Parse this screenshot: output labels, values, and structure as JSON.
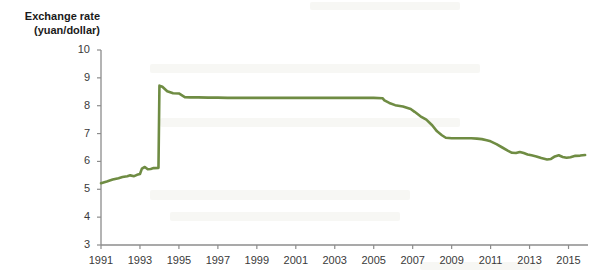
{
  "chart_data": {
    "type": "line",
    "title": "",
    "ylabel_line1": "Exchange rate",
    "ylabel_line2": "(yuan/dollar)",
    "xlabel": "",
    "ylim": [
      3,
      10
    ],
    "xlim": [
      1991,
      2016
    ],
    "grid": false,
    "legend": "none",
    "line_color": "#6f8c43",
    "axis_color": "#8c8c8c",
    "y_ticks": [
      10,
      9,
      8,
      7,
      6,
      5,
      4,
      3
    ],
    "x_ticks": [
      1991,
      1993,
      1995,
      1997,
      1999,
      2001,
      2003,
      2005,
      2007,
      2009,
      2011,
      2013,
      2015
    ],
    "series": [
      {
        "name": "Chinese yuan per U.S. dollar",
        "x": [
          1991.0,
          1991.3,
          1991.6,
          1991.9,
          1992.1,
          1992.35,
          1992.5,
          1992.7,
          1992.85,
          1993.0,
          1993.1,
          1993.25,
          1993.4,
          1993.55,
          1993.7,
          1993.95,
          1994.0,
          1994.15,
          1994.4,
          1994.7,
          1995.0,
          1995.3,
          1995.6,
          1996.0,
          1996.5,
          1997.0,
          1997.5,
          1998.0,
          1998.5,
          1999.0,
          1999.5,
          2000.0,
          2001.0,
          2002.0,
          2003.0,
          2004.0,
          2005.0,
          2005.45,
          2005.55,
          2005.8,
          2006.1,
          2006.5,
          2006.9,
          2007.1,
          2007.4,
          2007.7,
          2008.0,
          2008.25,
          2008.5,
          2008.7,
          2009.0,
          2009.5,
          2010.0,
          2010.3,
          2010.55,
          2010.8,
          2011.0,
          2011.3,
          2011.6,
          2011.9,
          2012.1,
          2012.3,
          2012.5,
          2012.7,
          2012.9,
          2013.1,
          2013.35,
          2013.6,
          2013.9,
          2014.1,
          2014.3,
          2014.5,
          2014.7,
          2014.9,
          2015.1,
          2015.35,
          2015.6,
          2015.85
        ],
        "y": [
          5.22,
          5.28,
          5.35,
          5.4,
          5.44,
          5.47,
          5.5,
          5.47,
          5.52,
          5.55,
          5.74,
          5.8,
          5.72,
          5.73,
          5.76,
          5.77,
          8.72,
          8.68,
          8.52,
          8.45,
          8.44,
          8.31,
          8.3,
          8.3,
          8.29,
          8.29,
          8.28,
          8.28,
          8.28,
          8.28,
          8.28,
          8.28,
          8.28,
          8.28,
          8.28,
          8.28,
          8.28,
          8.27,
          8.19,
          8.1,
          8.02,
          7.97,
          7.88,
          7.78,
          7.62,
          7.5,
          7.3,
          7.08,
          6.94,
          6.85,
          6.83,
          6.83,
          6.83,
          6.82,
          6.8,
          6.76,
          6.72,
          6.62,
          6.5,
          6.38,
          6.31,
          6.3,
          6.34,
          6.3,
          6.25,
          6.22,
          6.18,
          6.12,
          6.07,
          6.09,
          6.18,
          6.22,
          6.16,
          6.13,
          6.15,
          6.2,
          6.21,
          6.23
        ]
      }
    ],
    "annotations": []
  }
}
